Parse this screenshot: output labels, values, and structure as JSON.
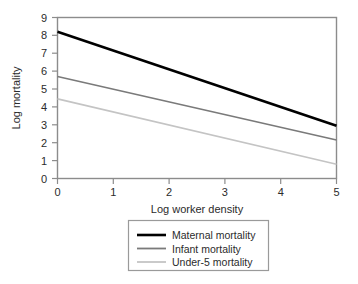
{
  "chart_data": {
    "type": "line",
    "title": "",
    "xlabel": "Log worker density",
    "ylabel": "Log mortality",
    "xlim": [
      0,
      5
    ],
    "ylim": [
      0,
      9
    ],
    "xticks": [
      "0",
      "1",
      "2",
      "3",
      "4",
      "5"
    ],
    "yticks": [
      "0",
      "1",
      "2",
      "3",
      "4",
      "5",
      "6",
      "7",
      "8",
      "9"
    ],
    "grid": false,
    "legend_position": "bottom-center",
    "x": [
      0,
      5
    ],
    "series": [
      {
        "name": "Maternal mortality",
        "values": [
          8.2,
          2.95
        ],
        "color": "#000000",
        "width": 2.6
      },
      {
        "name": "Infant mortality",
        "values": [
          5.7,
          2.15
        ],
        "color": "#7a7a7a",
        "width": 1.6
      },
      {
        "name": "Under-5 mortality",
        "values": [
          4.45,
          0.8
        ],
        "color": "#c4c4c4",
        "width": 1.6
      }
    ]
  },
  "axes": {
    "y_title": "Log mortality",
    "x_title": "Log worker density",
    "y_tick_0": "0",
    "y_tick_1": "1",
    "y_tick_2": "2",
    "y_tick_3": "3",
    "y_tick_4": "4",
    "y_tick_5": "5",
    "y_tick_6": "6",
    "y_tick_7": "7",
    "y_tick_8": "8",
    "y_tick_9": "9",
    "x_tick_0": "0",
    "x_tick_1": "1",
    "x_tick_2": "2",
    "x_tick_3": "3",
    "x_tick_4": "4",
    "x_tick_5": "5"
  },
  "legend": {
    "entry_0": "Maternal mortality",
    "entry_1": "Infant mortality",
    "entry_2": "Under-5 mortality"
  },
  "colors": {
    "maternal": "#000000",
    "infant": "#7a7a7a",
    "under5": "#c4c4c4",
    "frame": "#8c8c8c",
    "legend_border": "#9a9a9a",
    "background": "#ffffff"
  }
}
